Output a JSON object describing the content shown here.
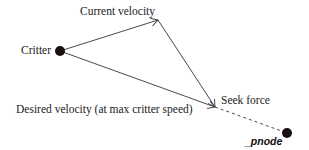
{
  "diagram": {
    "labels": {
      "current_velocity": "Current velocity",
      "critter": "Critter",
      "desired_velocity": "Desired velocity (at max critter speed)",
      "seek_force": "Seek force",
      "pnode": "_pnode"
    },
    "points": {
      "critter": {
        "x": 60,
        "y": 51
      },
      "current_velocity_tip": {
        "x": 158,
        "y": 20
      },
      "desired_velocity_tip": {
        "x": 215,
        "y": 107
      },
      "pnode": {
        "x": 287,
        "y": 133
      }
    },
    "colors": {
      "line": "#4a4a4a",
      "node": "#1a1111",
      "text": "#222222"
    }
  }
}
